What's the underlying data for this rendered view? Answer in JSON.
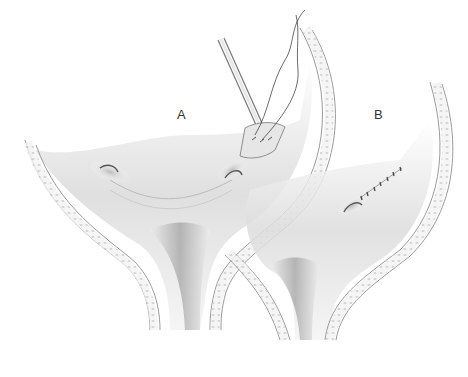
{
  "figure": {
    "panels": [
      {
        "label": "A",
        "content": "needle holder placing sutures through tissue fold"
      },
      {
        "label": "B",
        "content": "completed interrupted suture line"
      }
    ],
    "signature": "artist signature"
  }
}
